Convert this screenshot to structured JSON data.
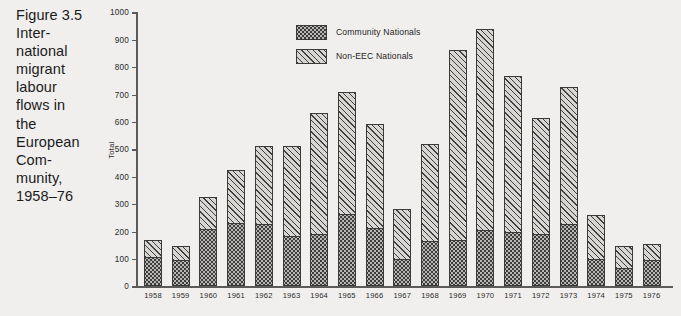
{
  "caption": {
    "lines": [
      "Figure 3.5",
      "Inter-",
      "national",
      "migrant",
      "labour",
      "flows in",
      "the",
      "European",
      "Com-",
      "munity,",
      "1958–76"
    ]
  },
  "legend": {
    "position": "top-left-inside",
    "entries": [
      {
        "label": "Community Nationals",
        "pattern": "dotted-stipple",
        "color": "#b9b7b3"
      },
      {
        "label": "Non-EEC Nationals",
        "pattern": "diagonal-hatch",
        "color": "#d8d6d2"
      }
    ]
  },
  "axes": {
    "ylabel": "Total",
    "yticks": [
      "0",
      "100",
      "200",
      "300",
      "400",
      "500",
      "600",
      "700",
      "800",
      "900",
      "1000"
    ],
    "ytick_values": [
      0,
      100,
      200,
      300,
      400,
      500,
      600,
      700,
      800,
      900,
      1000
    ],
    "xlabel": ""
  },
  "colors": {
    "background": "#f0efed",
    "axis": "#5b5b5b",
    "text": "#1b1b1b",
    "bar_outline": "#3a3a3a",
    "community_fill": "#b9b7b3",
    "non_eec_fill": "#d8d6d2"
  },
  "chart_data": {
    "type": "bar",
    "xlabel": "",
    "ylabel": "Total",
    "ylim": [
      0,
      1000
    ],
    "grid": false,
    "legend_position": "upper left (inside plot)",
    "stacked": true,
    "categories": [
      "1958",
      "1959",
      "1960",
      "1961",
      "1962",
      "1963",
      "1964",
      "1965",
      "1966",
      "1967",
      "1968",
      "1969",
      "1970",
      "1971",
      "1972",
      "1973",
      "1974",
      "1975",
      "1976"
    ],
    "series": [
      {
        "name": "Community Nationals",
        "values": [
          109,
          97,
          210,
          230,
          226,
          185,
          190,
          263,
          212,
          100,
          165,
          170,
          205,
          200,
          190,
          228,
          100,
          68,
          95
        ]
      },
      {
        "name": "Non-EEC Nationals",
        "values": [
          65,
          55,
          120,
          200,
          290,
          331,
          445,
          449,
          383,
          187,
          357,
          695,
          740,
          570,
          430,
          502,
          165,
          84,
          63
        ]
      }
    ],
    "totals": [
      174,
      152,
      330,
      430,
      516,
      516,
      635,
      712,
      595,
      287,
      522,
      865,
      945,
      770,
      620,
      730,
      265,
      152,
      158
    ]
  }
}
